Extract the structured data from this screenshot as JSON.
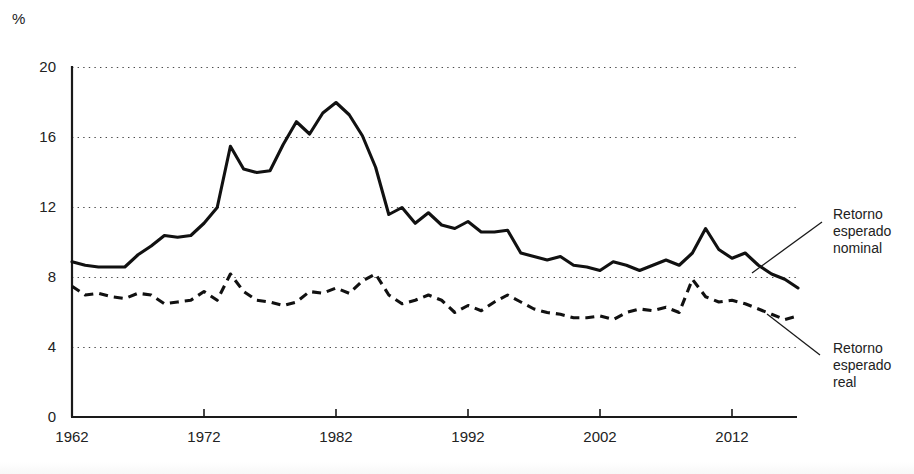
{
  "chart_data": {
    "type": "line",
    "title": "",
    "subtitle": "",
    "xlabel": "",
    "ylabel": "%",
    "unit_label": "%",
    "xlim": [
      1962,
      2017
    ],
    "ylim": [
      0,
      20
    ],
    "yticks": [
      0,
      4,
      8,
      12,
      16,
      20
    ],
    "ytick_labels": [
      "0",
      "4",
      "8",
      "12",
      "16",
      "20"
    ],
    "xticks": [
      1962,
      1972,
      1982,
      1992,
      2002,
      2012
    ],
    "xtick_labels": [
      "1962",
      "1972",
      "1982",
      "1992",
      "2002",
      "2012"
    ],
    "grid": "horizontal-dotted",
    "legend_position": "right-annotations",
    "x": [
      1962,
      1963,
      1964,
      1965,
      1966,
      1967,
      1968,
      1969,
      1970,
      1971,
      1972,
      1973,
      1974,
      1975,
      1976,
      1977,
      1978,
      1979,
      1980,
      1981,
      1982,
      1983,
      1984,
      1985,
      1986,
      1987,
      1988,
      1989,
      1990,
      1991,
      1992,
      1993,
      1994,
      1995,
      1996,
      1997,
      1998,
      1999,
      2000,
      2001,
      2002,
      2003,
      2004,
      2005,
      2006,
      2007,
      2008,
      2009,
      2010,
      2011,
      2012,
      2013,
      2014,
      2015,
      2016,
      2017
    ],
    "series": [
      {
        "name": "Retorno esperado nominal",
        "style": "solid",
        "color": "#111111",
        "values": [
          8.9,
          8.7,
          8.6,
          8.6,
          8.6,
          9.3,
          9.8,
          10.4,
          10.3,
          10.4,
          11.1,
          12.0,
          15.5,
          14.2,
          14.0,
          14.1,
          15.6,
          16.9,
          16.2,
          17.4,
          18.0,
          17.3,
          16.1,
          14.3,
          11.6,
          12.0,
          11.1,
          11.7,
          11.0,
          10.8,
          11.2,
          10.6,
          10.6,
          10.7,
          9.4,
          9.2,
          9.0,
          9.2,
          8.7,
          8.6,
          8.4,
          8.9,
          8.7,
          8.4,
          8.7,
          9.0,
          8.7,
          9.4,
          10.8,
          9.6,
          9.1,
          9.4,
          8.7,
          8.2,
          7.9,
          7.4
        ]
      },
      {
        "name": "Retorno esperado real",
        "style": "dashed",
        "color": "#111111",
        "values": [
          7.5,
          7.0,
          7.1,
          6.9,
          6.8,
          7.1,
          7.0,
          6.5,
          6.6,
          6.7,
          7.2,
          6.7,
          8.2,
          7.2,
          6.7,
          6.6,
          6.4,
          6.6,
          7.2,
          7.1,
          7.4,
          7.1,
          7.8,
          8.2,
          7.0,
          6.5,
          6.7,
          7.0,
          6.7,
          6.0,
          6.4,
          6.1,
          6.6,
          7.0,
          6.6,
          6.2,
          6.0,
          5.9,
          5.7,
          5.7,
          5.8,
          5.6,
          6.0,
          6.2,
          6.1,
          6.3,
          6.0,
          7.9,
          6.9,
          6.6,
          6.7,
          6.5,
          6.2,
          5.9,
          5.6,
          5.8
        ]
      }
    ]
  },
  "axis": {
    "unit": "%"
  },
  "annotations": [
    {
      "id": "nominal",
      "lines": [
        "Retorno",
        "esperado",
        "nominal"
      ],
      "leader": "diagonal-line"
    },
    {
      "id": "real",
      "lines": [
        "Retorno",
        "esperado",
        "real"
      ],
      "leader": "diagonal-line"
    }
  ]
}
